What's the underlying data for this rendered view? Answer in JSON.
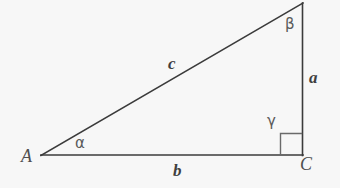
{
  "figure": {
    "background_color": "#f7f7f7",
    "stroke_color": "#3b3b3b",
    "text_color": "#4a4a4a",
    "width": 340,
    "height": 188,
    "vertices": [
      {
        "name": "A",
        "label": "A",
        "x": 41,
        "y": 155
      },
      {
        "name": "B",
        "label": "",
        "x": 303,
        "y": 3
      },
      {
        "name": "C",
        "label": "C",
        "x": 303,
        "y": 155
      }
    ],
    "sides": [
      {
        "name": "a",
        "label": "a",
        "from": "B",
        "to": "C",
        "label_x": 309,
        "label_y": 69
      },
      {
        "name": "b",
        "label": "b",
        "from": "A",
        "to": "C",
        "label_x": 173,
        "label_y": 162
      },
      {
        "name": "c",
        "label": "c",
        "from": "A",
        "to": "B",
        "label_x": 168,
        "label_y": 55
      }
    ],
    "angles": [
      {
        "name": "alpha",
        "label": "α",
        "at_vertex": "A",
        "label_x": 75,
        "label_y": 136
      },
      {
        "name": "beta",
        "label": "β",
        "at_vertex": "B",
        "label_x": 285,
        "label_y": 17
      },
      {
        "name": "gamma",
        "label": "γ",
        "at_vertex": "C",
        "label_x": 267,
        "label_y": 114,
        "is_right_angle": true
      }
    ],
    "right_angle_marker": {
      "name": "right-angle-marker",
      "x": 280,
      "y": 133,
      "size": 22
    },
    "labels": {
      "vertex_A": "A",
      "vertex_C": "C",
      "side_a": "a",
      "side_b": "b",
      "side_c": "c",
      "angle_alpha": "α",
      "angle_beta": "β",
      "angle_gamma": "γ"
    }
  }
}
